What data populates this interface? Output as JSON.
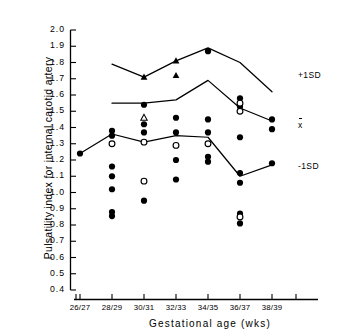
{
  "chart_data": {
    "type": "scatter",
    "title": "",
    "xlabel": "Gestational age  (wks)",
    "ylabel": "Pulsatility index for internal carotid artery",
    "categories": [
      "26/27",
      "28/29",
      "30/31",
      "32/33",
      "34/35",
      "36/37",
      "38/39"
    ],
    "ylim": [
      0.4,
      2.0
    ],
    "yticks": [
      "2.0",
      "1.9",
      "1.8",
      "1.7",
      "1.6",
      "1.5",
      "1.4",
      "1.3",
      "1.2",
      "1.1",
      "1.0",
      "0.9",
      "0.8",
      "0.7",
      "0.6",
      "0.5",
      "0.4"
    ],
    "grid": false,
    "legend_position": "right-inline",
    "annotations": [
      {
        "text": "+1SD",
        "x_category": "38/39",
        "value": 1.72
      },
      {
        "text": "x",
        "x_category": "38/39",
        "value": 1.41,
        "overbar": true
      },
      {
        "text": "-1SD",
        "x_category": "38/39",
        "value": 1.16
      }
    ],
    "reference_lines": [
      {
        "name": "+1SD",
        "categories": [
          "28/29",
          "30/31",
          "32/33",
          "34/35",
          "36/37",
          "38/39"
        ],
        "values": [
          1.79,
          1.71,
          1.81,
          1.89,
          1.8,
          1.62
        ]
      },
      {
        "name": "mean",
        "categories": [
          "28/29",
          "30/31",
          "32/33",
          "34/35",
          "36/37",
          "38/39"
        ],
        "values": [
          1.55,
          1.55,
          1.57,
          1.69,
          1.52,
          1.44
        ]
      },
      {
        "name": "-1SD",
        "categories": [
          "26/27",
          "28/29",
          "30/31",
          "32/33",
          "34/35",
          "36/37",
          "38/39"
        ],
        "values": [
          1.24,
          1.36,
          1.31,
          1.35,
          1.34,
          1.1,
          1.17
        ]
      }
    ],
    "series": [
      {
        "name": "filled-circle",
        "marker": "filled-circle",
        "points": [
          {
            "x": "26/27",
            "y": 1.24
          },
          {
            "x": "28/29",
            "y": 1.38
          },
          {
            "x": "28/29",
            "y": 1.35
          },
          {
            "x": "28/29",
            "y": 1.16
          },
          {
            "x": "28/29",
            "y": 1.1
          },
          {
            "x": "28/29",
            "y": 1.02
          },
          {
            "x": "28/29",
            "y": 0.88
          },
          {
            "x": "28/29",
            "y": 0.855
          },
          {
            "x": "30/31",
            "y": 1.54
          },
          {
            "x": "30/31",
            "y": 1.42
          },
          {
            "x": "30/31",
            "y": 1.37
          },
          {
            "x": "30/31",
            "y": 0.95
          },
          {
            "x": "32/33",
            "y": 1.46
          },
          {
            "x": "32/33",
            "y": 1.37
          },
          {
            "x": "32/33",
            "y": 1.2
          },
          {
            "x": "32/33",
            "y": 1.08
          },
          {
            "x": "34/35",
            "y": 1.45
          },
          {
            "x": "34/35",
            "y": 1.37
          },
          {
            "x": "34/35",
            "y": 1.22
          },
          {
            "x": "34/35",
            "y": 1.19
          },
          {
            "x": "34/35",
            "y": 1.87
          },
          {
            "x": "36/37",
            "y": 1.58
          },
          {
            "x": "36/37",
            "y": 1.53
          },
          {
            "x": "36/37",
            "y": 1.34
          },
          {
            "x": "36/37",
            "y": 1.12
          },
          {
            "x": "36/37",
            "y": 1.06
          },
          {
            "x": "36/37",
            "y": 0.87
          },
          {
            "x": "36/37",
            "y": 0.81
          },
          {
            "x": "38/39",
            "y": 1.45
          },
          {
            "x": "38/39",
            "y": 1.39
          },
          {
            "x": "38/39",
            "y": 1.18
          }
        ]
      },
      {
        "name": "open-circle",
        "marker": "open-circle",
        "points": [
          {
            "x": "28/29",
            "y": 1.3
          },
          {
            "x": "30/31",
            "y": 1.31
          },
          {
            "x": "30/31",
            "y": 1.07
          },
          {
            "x": "32/33",
            "y": 1.29
          },
          {
            "x": "34/35",
            "y": 1.3
          },
          {
            "x": "36/37",
            "y": 1.55
          },
          {
            "x": "36/37",
            "y": 1.5
          },
          {
            "x": "36/37",
            "y": 0.85
          }
        ]
      },
      {
        "name": "filled-triangle",
        "marker": "filled-triangle",
        "points": [
          {
            "x": "30/31",
            "y": 1.71
          },
          {
            "x": "32/33",
            "y": 1.81
          },
          {
            "x": "32/33",
            "y": 1.72
          }
        ]
      },
      {
        "name": "open-triangle",
        "marker": "open-triangle",
        "points": [
          {
            "x": "30/31",
            "y": 1.46
          }
        ]
      }
    ]
  }
}
